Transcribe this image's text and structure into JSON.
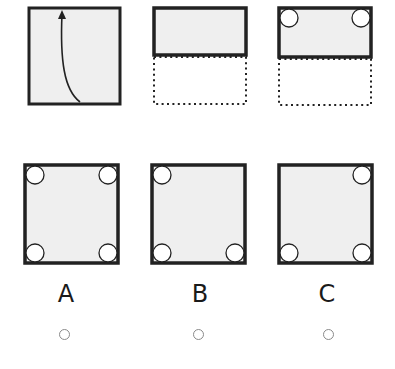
{
  "puzzle": {
    "type": "paper-folding-hole-punch",
    "step_1": {
      "description": "square paper with upward fold arrow",
      "icon": "curved-arrow-up-icon"
    },
    "step_2": {
      "description": "paper folded in half, bottom half shown dotted"
    },
    "step_3": {
      "description": "folded paper with holes punched at top-left and top-right corners",
      "holes": [
        "top-left",
        "top-right"
      ]
    }
  },
  "options": [
    {
      "label": "A",
      "holes": [
        "top-left",
        "top-right",
        "bottom-left",
        "bottom-right"
      ]
    },
    {
      "label": "B",
      "holes": [
        "top-left",
        "bottom-left",
        "bottom-right"
      ]
    },
    {
      "label": "C",
      "holes": [
        "top-right",
        "bottom-left",
        "bottom-right"
      ]
    }
  ],
  "colors": {
    "paper_fill": "#efefef",
    "border": "#222222",
    "hole_fill": "#ffffff",
    "dotted": "#222222",
    "radio_border": "#8a8a8a"
  }
}
